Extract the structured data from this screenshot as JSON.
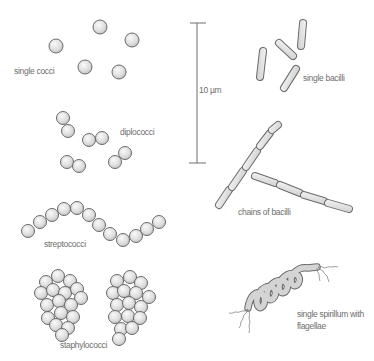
{
  "diagram": {
    "colors": {
      "cell_fill": "#e2e2e2",
      "cell_outline": "#6a6a6a",
      "label": "#6e6e6e"
    },
    "scale_bar": {
      "label": "10 µm",
      "x": 197,
      "y_top": 23,
      "y_bottom": 163
    },
    "groups": [
      {
        "id": "single-cocci",
        "label": "single cocci",
        "label_pos": [
          14,
          74
        ],
        "shape": "coccus",
        "radius": 7,
        "cells": [
          [
            56,
            46
          ],
          [
            100,
            27
          ],
          [
            132,
            40
          ],
          [
            85,
            67
          ],
          [
            119,
            72
          ]
        ]
      },
      {
        "id": "diplococci",
        "label": "diplococci",
        "label_pos": [
          120,
          135
        ],
        "shape": "coccus",
        "radius": 6.5,
        "cells": [
          [
            63,
            118
          ],
          [
            68,
            131
          ],
          [
            89,
            140
          ],
          [
            102,
            138
          ],
          [
            67,
            162
          ],
          [
            79,
            166
          ],
          [
            115,
            162
          ],
          [
            125,
            153
          ]
        ]
      },
      {
        "id": "streptococci",
        "label": "streptococci",
        "label_pos": [
          44,
          247
        ],
        "shape": "coccus",
        "radius": 6.5,
        "cells": [
          [
            28,
            231
          ],
          [
            40,
            222
          ],
          [
            52,
            215
          ],
          [
            64,
            209
          ],
          [
            77,
            208
          ],
          [
            89,
            215
          ],
          [
            99,
            225
          ],
          [
            110,
            234
          ],
          [
            123,
            240
          ],
          [
            136,
            236
          ],
          [
            147,
            229
          ],
          [
            159,
            222
          ]
        ]
      },
      {
        "id": "staphylococci",
        "label": "staphylococci",
        "label_pos": [
          60,
          348
        ],
        "shape": "coccus",
        "radius": 6.5,
        "cells": [
          [
            46,
            282
          ],
          [
            58,
            276
          ],
          [
            70,
            281
          ],
          [
            41,
            293
          ],
          [
            53,
            290
          ],
          [
            65,
            293
          ],
          [
            77,
            289
          ],
          [
            81,
            298
          ],
          [
            47,
            305
          ],
          [
            59,
            301
          ],
          [
            71,
            305
          ],
          [
            61,
            313
          ],
          [
            48,
            318
          ],
          [
            73,
            317
          ],
          [
            56,
            325
          ],
          [
            68,
            328
          ],
          [
            62,
            335
          ],
          [
            117,
            281
          ],
          [
            130,
            277
          ],
          [
            141,
            283
          ],
          [
            113,
            293
          ],
          [
            124,
            291
          ],
          [
            136,
            293
          ],
          [
            149,
            297
          ],
          [
            117,
            305
          ],
          [
            129,
            303
          ],
          [
            141,
            307
          ],
          [
            115,
            317
          ],
          [
            128,
            316
          ],
          [
            140,
            318
          ],
          [
            121,
            329
          ],
          [
            132,
            328
          ],
          [
            119,
            339
          ]
        ]
      },
      {
        "id": "single-bacilli",
        "label": "single bacilli",
        "label_pos": [
          303,
          81
        ],
        "shape": "bacillus",
        "width": 7,
        "rods": [
          [
            263,
            51,
            260,
            77
          ],
          [
            279,
            43,
            293,
            56
          ],
          [
            303,
            23,
            301,
            46
          ],
          [
            284,
            88,
            296,
            69
          ]
        ]
      },
      {
        "id": "chains-of-bacilli",
        "label": "chains of bacilli",
        "label_pos": [
          238,
          215
        ],
        "shape": "bacillus",
        "width": 7,
        "rods": [
          [
            219,
            205,
            229,
            190
          ],
          [
            232,
            187,
            243,
            171
          ],
          [
            246,
            167,
            257,
            151
          ],
          [
            260,
            146,
            270,
            133
          ],
          [
            272,
            130,
            278,
            125
          ],
          [
            255,
            176,
            275,
            183
          ],
          [
            280,
            185,
            300,
            193
          ],
          [
            304,
            195,
            324,
            201
          ],
          [
            328,
            203,
            349,
            209
          ]
        ]
      },
      {
        "id": "spirillum",
        "label_line1": "single spirillum with",
        "label_line2": "flagellae",
        "label_pos": [
          297,
          317
        ],
        "shape": "spirillum"
      }
    ]
  }
}
